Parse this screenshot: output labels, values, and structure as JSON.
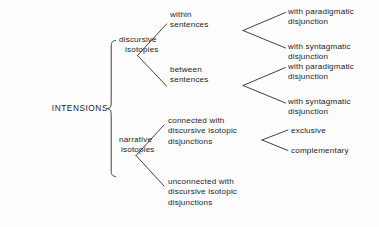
{
  "diagram": {
    "type": "taxonomy-tree",
    "orientation": "left-to-right",
    "background_color": "#fdfdfd",
    "line_color": "#2b2b2b",
    "text_color": "#1c1c1c",
    "root": {
      "id": "intensions",
      "label": "INTENSIONS"
    },
    "level1": [
      {
        "id": "discursive-isotopies",
        "line1": "discursive",
        "line2": "isotopies"
      },
      {
        "id": "narrative-isotopies",
        "line1": "narrative",
        "line2": "isotopies"
      }
    ],
    "level2": [
      {
        "id": "within-sentences",
        "line1": "within",
        "line2": "sentences",
        "line3": ""
      },
      {
        "id": "between-sentences",
        "line1": "between",
        "line2": "sentences",
        "line3": ""
      },
      {
        "id": "connected-with-discursive-isotopic-disjunctions",
        "line1": "connected with",
        "line2": "discursive isotopic",
        "line3": "disjunctions"
      },
      {
        "id": "unconnected-with-discursive-isotopic-disjunctions",
        "line1": "unconnected with",
        "line2": "discursive  isotopic",
        "line3": "disjunctions"
      }
    ],
    "level3": [
      {
        "id": "within-with-paradigmatic-disjunction",
        "line1": "with paradigmatic",
        "line2": "disjunction"
      },
      {
        "id": "within-with-syntagmatic-disjunction",
        "line1": "with syntagmatic",
        "line2": "disjunction"
      },
      {
        "id": "between-with-paradigmatic-disjunction",
        "line1": "with paradigmatic",
        "line2": "disjunction"
      },
      {
        "id": "between-with-syntagmatic-disjunction",
        "line1": "with syntagmatic",
        "line2": "disjunction"
      },
      {
        "id": "exclusive",
        "line1": "exclusive",
        "line2": ""
      },
      {
        "id": "complementary",
        "line1": "complementary",
        "line2": ""
      }
    ]
  }
}
